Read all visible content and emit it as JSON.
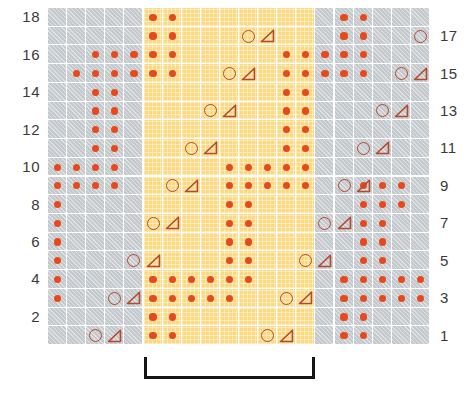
{
  "chart_data": {
    "type": "table",
    "grid": {
      "columns": 20,
      "rows": 18
    },
    "row_labels_left": [
      "18",
      "16",
      "14",
      "12",
      "10",
      "8",
      "6",
      "4",
      "2"
    ],
    "row_labels_right": [
      "17",
      "15",
      "13",
      "11",
      "9",
      "7",
      "5",
      "3",
      "1"
    ],
    "legend_colors": {
      "background_plain": "#c3c9cc",
      "background_repeat": "#fbd980",
      "dot": "#e8491c",
      "outline": "#b5482e",
      "bracket": "#151515"
    },
    "repeat_bracket": {
      "start_column": 6,
      "end_column": 14,
      "label": ""
    },
    "symbols": {
      "dot": "bobble-dot",
      "circle": "yarn-over-circle",
      "triangle": "decrease-triangle"
    },
    "highlight_columns": [
      6,
      7,
      8,
      9,
      10,
      11,
      12,
      13,
      14
    ],
    "rows": [
      {
        "number": 18,
        "side": "left",
        "dots": [
          6,
          7,
          16,
          17
        ],
        "circles": [],
        "triangles": []
      },
      {
        "number": 17,
        "side": "right",
        "dots": [
          6,
          7,
          16,
          17
        ],
        "circles": [
          11,
          20
        ],
        "triangles": [
          12,
          21
        ]
      },
      {
        "number": 16,
        "side": "left",
        "dots": [
          3,
          4,
          5,
          6,
          7,
          13,
          14,
          15,
          16,
          17
        ],
        "circles": [],
        "triangles": []
      },
      {
        "number": 15,
        "side": "right",
        "dots": [
          2,
          3,
          4,
          5,
          6,
          7,
          13,
          14,
          15,
          16,
          17
        ],
        "circles": [
          10,
          19
        ],
        "triangles": [
          11,
          20
        ]
      },
      {
        "number": 14,
        "side": "left",
        "dots": [
          3,
          4,
          13,
          14
        ],
        "circles": [],
        "triangles": []
      },
      {
        "number": 13,
        "side": "right",
        "dots": [
          3,
          4,
          13,
          14
        ],
        "circles": [
          9,
          18
        ],
        "triangles": [
          10,
          19
        ]
      },
      {
        "number": 12,
        "side": "left",
        "dots": [
          3,
          4,
          13,
          14
        ],
        "circles": [],
        "triangles": []
      },
      {
        "number": 11,
        "side": "right",
        "dots": [
          3,
          4,
          13,
          14
        ],
        "circles": [
          8,
          17
        ],
        "triangles": [
          9,
          18
        ]
      },
      {
        "number": 10,
        "side": "left",
        "dots": [
          1,
          2,
          3,
          4,
          10,
          11,
          12,
          13,
          14
        ],
        "circles": [],
        "triangles": []
      },
      {
        "number": 9,
        "side": "right",
        "dots": [
          1,
          2,
          3,
          4,
          10,
          11,
          12,
          13,
          14,
          17,
          18,
          19
        ],
        "circles": [
          7,
          16
        ],
        "triangles": [
          8,
          17
        ]
      },
      {
        "number": 8,
        "side": "left",
        "dots": [
          1,
          10,
          11,
          17,
          18,
          19
        ],
        "circles": [],
        "triangles": []
      },
      {
        "number": 7,
        "side": "right",
        "dots": [
          1,
          10,
          11,
          17,
          18
        ],
        "circles": [
          6,
          15
        ],
        "triangles": [
          7,
          16
        ]
      },
      {
        "number": 6,
        "side": "left",
        "dots": [
          1,
          10,
          11,
          17,
          18
        ],
        "circles": [],
        "triangles": []
      },
      {
        "number": 5,
        "side": "right",
        "dots": [
          1,
          10,
          11,
          17,
          18
        ],
        "circles": [
          5,
          14
        ],
        "triangles": [
          6,
          15
        ]
      },
      {
        "number": 4,
        "side": "left",
        "dots": [
          1,
          6,
          7,
          8,
          9,
          10,
          11,
          16,
          17,
          18,
          19,
          20
        ],
        "circles": [],
        "triangles": []
      },
      {
        "number": 3,
        "side": "right",
        "dots": [
          1,
          6,
          7,
          8,
          9,
          10,
          16,
          17,
          18,
          19,
          20
        ],
        "circles": [
          4,
          13
        ],
        "triangles": [
          5,
          14
        ]
      },
      {
        "number": 2,
        "side": "left",
        "dots": [
          6,
          7,
          16,
          17
        ],
        "circles": [],
        "triangles": []
      },
      {
        "number": 1,
        "side": "right",
        "dots": [
          6,
          7,
          16,
          17
        ],
        "circles": [
          3,
          12
        ],
        "triangles": [
          4,
          13
        ]
      }
    ]
  }
}
